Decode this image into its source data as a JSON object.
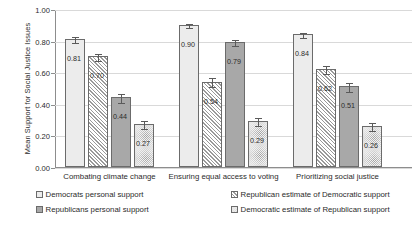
{
  "chart_data": {
    "type": "bar",
    "title": "",
    "xlabel": "",
    "ylabel": "Mean Support for Social Justice Issues",
    "ylim": [
      0.0,
      1.0
    ],
    "ytick_labels": [
      "1.00",
      "0.80",
      "0.60",
      "0.40",
      "0.20",
      "0.00"
    ],
    "ytick_values": [
      1.0,
      0.8,
      0.6,
      0.4,
      0.2,
      0.0
    ],
    "grid": true,
    "legend_position": "bottom",
    "categories": [
      "Combating climate change",
      "Ensuring equal access to voting",
      "Prioritizing social justice"
    ],
    "series": [
      {
        "name": "Democrats personal support",
        "fill": "solid-light",
        "values": [
          0.81,
          0.9,
          0.84
        ],
        "labels": [
          "0.81",
          "0.90",
          "0.84"
        ],
        "errors": [
          0.018,
          0.014,
          0.017
        ]
      },
      {
        "name": "Republican estimate of Democratic support",
        "fill": "hatch",
        "values": [
          0.7,
          0.54,
          0.62
        ],
        "labels": [
          "0.70",
          "0.54",
          "0.62"
        ],
        "errors": [
          0.024,
          0.03,
          0.026
        ]
      },
      {
        "name": "Republicans personal support",
        "fill": "solid-mid",
        "values": [
          0.44,
          0.79,
          0.51
        ],
        "labels": [
          "0.44",
          "0.79",
          "0.51"
        ],
        "errors": [
          0.027,
          0.021,
          0.028
        ]
      },
      {
        "name": "Democratic estimate of Republican support",
        "fill": "dots",
        "values": [
          0.27,
          0.29,
          0.26
        ],
        "labels": [
          "0.27",
          "0.29",
          "0.26"
        ],
        "errors": [
          0.026,
          0.026,
          0.025
        ]
      }
    ]
  },
  "legend": {
    "items": [
      {
        "label": "Democrats personal support",
        "fill": "solid-light"
      },
      {
        "label": "Republicans personal support",
        "fill": "solid-mid"
      },
      {
        "label": "Republican estimate of Democratic support",
        "fill": "hatch"
      },
      {
        "label": "Democratic estimate of Republican support",
        "fill": "dots"
      }
    ]
  },
  "colors": {
    "solid_light": "#ececec",
    "solid_mid": "#a8a8a8",
    "hatch_line": "#9a9a9a",
    "dots": "#9d9d9d",
    "grid": "#d9d9d9",
    "axis": "#8d8d8d",
    "text": "#2b2b2b"
  }
}
